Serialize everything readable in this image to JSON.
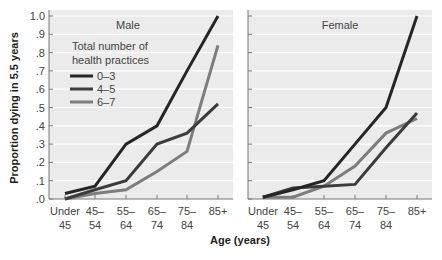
{
  "chart_data": {
    "type": "line",
    "ylabel": "Proportion dying in 5.5 years",
    "xlabel": "Age (years)",
    "ylim": [
      0,
      1.0
    ],
    "yticks": [
      ".0",
      ".1",
      ".2",
      ".3",
      ".4",
      ".5",
      ".6",
      ".7",
      ".8",
      ".9",
      "1.0"
    ],
    "grid": true,
    "categories": [
      [
        "Under",
        "45"
      ],
      [
        "45–",
        "54"
      ],
      [
        "55–",
        "64"
      ],
      [
        "65–",
        "74"
      ],
      [
        "75–",
        "84"
      ],
      [
        "85+",
        ""
      ]
    ],
    "legend": {
      "title_line1": "Total number of",
      "title_line2": "health practices",
      "position": "upper-left of Male panel",
      "entries": [
        {
          "label": "0–3",
          "color": "#262626"
        },
        {
          "label": "4–5",
          "color": "#3c3c3c"
        },
        {
          "label": "6–7",
          "color": "#7d7d7d"
        }
      ]
    },
    "panels": [
      {
        "title": "Male",
        "series": [
          {
            "name": "0–3",
            "color": "#262626",
            "values": [
              0.03,
              0.07,
              0.3,
              0.4,
              0.7,
              1.0
            ]
          },
          {
            "name": "4–5",
            "color": "#3c3c3c",
            "values": [
              0.0,
              0.05,
              0.1,
              0.3,
              0.36,
              0.52
            ]
          },
          {
            "name": "6–7",
            "color": "#7d7d7d",
            "values": [
              0.0,
              0.03,
              0.05,
              0.15,
              0.26,
              0.84
            ]
          }
        ]
      },
      {
        "title": "Female",
        "series": [
          {
            "name": "0–3",
            "color": "#262626",
            "values": [
              0.01,
              0.05,
              0.1,
              0.3,
              0.5,
              1.0
            ]
          },
          {
            "name": "4–5",
            "color": "#3c3c3c",
            "values": [
              0.01,
              0.06,
              0.07,
              0.08,
              0.28,
              0.47
            ]
          },
          {
            "name": "6–7",
            "color": "#7d7d7d",
            "values": [
              0.01,
              0.01,
              0.07,
              0.18,
              0.36,
              0.44
            ]
          }
        ]
      }
    ]
  }
}
